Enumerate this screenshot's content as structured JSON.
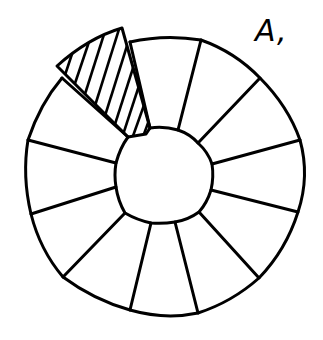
{
  "figure": {
    "label": "A,",
    "ring": {
      "center": [
        165,
        176
      ],
      "outer_radius": 140,
      "inner_radius": 47,
      "sector_count": 12
    },
    "highlighted_sector": {
      "position": "upper-left",
      "fill": "diagonal-hatch",
      "exploded": true
    },
    "colors": {
      "stroke": "#000000",
      "background": "#ffffff"
    }
  }
}
